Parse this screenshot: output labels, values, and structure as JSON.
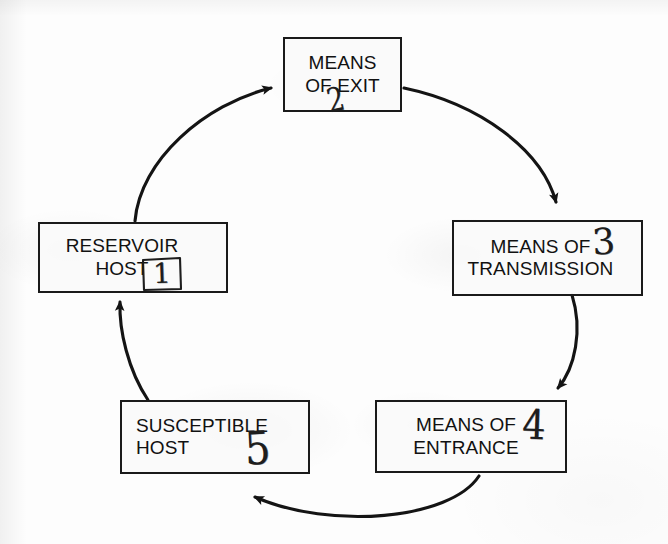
{
  "diagram": {
    "type": "cycle-diagram",
    "node_count": 5,
    "ink_color": "#1a1a1a",
    "paper_color": "#fdfdfd",
    "nodes": [
      {
        "id": "reservoir-host",
        "label": "RESERVOIR\nHOST",
        "hand_number": "1",
        "hand_number_boxed": true,
        "position": "left"
      },
      {
        "id": "means-of-exit",
        "label": "MEANS\nOF EXIT",
        "hand_number": "2",
        "hand_number_boxed": false,
        "position": "top"
      },
      {
        "id": "means-of-transmission",
        "label": "MEANS OF\nTRANSMISSION",
        "hand_number": "3",
        "hand_number_boxed": false,
        "position": "right"
      },
      {
        "id": "means-of-entrance",
        "label": "MEANS OF\nENTRANCE",
        "hand_number": "4",
        "hand_number_boxed": false,
        "position": "bottom-right"
      },
      {
        "id": "susceptible-host",
        "label": "SUSCEPTIBLE\nHOST",
        "hand_number": "5",
        "hand_number_boxed": false,
        "position": "bottom-left"
      }
    ],
    "arrows": [
      {
        "id": "arrow-reservoir-to-exit",
        "from": "reservoir-host",
        "to": "means-of-exit"
      },
      {
        "id": "arrow-exit-to-transmission",
        "from": "means-of-exit",
        "to": "means-of-transmission"
      },
      {
        "id": "arrow-transmission-to-entrance",
        "from": "means-of-transmission",
        "to": "means-of-entrance"
      },
      {
        "id": "arrow-entrance-to-susceptible",
        "from": "means-of-entrance",
        "to": "susceptible-host"
      },
      {
        "id": "arrow-susceptible-to-reservoir",
        "from": "susceptible-host",
        "to": "reservoir-host"
      }
    ]
  }
}
